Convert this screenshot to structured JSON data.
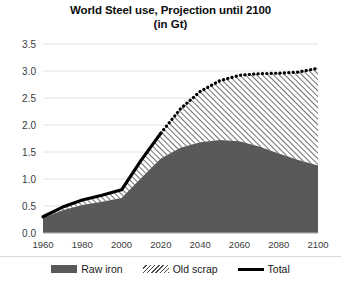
{
  "chart": {
    "title": "World Steel use, Projection until 2100",
    "subtitle": "(in Gt)"
  },
  "legend": {
    "items": [
      {
        "label": "Raw iron",
        "swatch": "solid-fill",
        "color": "#595959"
      },
      {
        "label": "Old scrap",
        "swatch": "diagonal-hatch",
        "color": "#4a4a4a"
      },
      {
        "label": "Total",
        "swatch": "line",
        "color": "#000000"
      }
    ]
  },
  "axes": {
    "y_ticks": [
      "0.0",
      "0.5",
      "1.0",
      "1.5",
      "2.0",
      "2.5",
      "3.0",
      "3.5"
    ],
    "x_ticks": [
      "1960",
      "1980",
      "2000",
      "2020",
      "2040",
      "2060",
      "2080",
      "2100"
    ]
  },
  "chart_data": {
    "type": "area",
    "title": "World Steel use, Projection until 2100",
    "subtitle": "(in Gt)",
    "xlabel": "",
    "ylabel": "",
    "unit": "Gt",
    "stacked": true,
    "grid": true,
    "legend_position": "bottom",
    "xlim": [
      1960,
      2100
    ],
    "ylim": [
      0.0,
      3.5
    ],
    "ytick_interval": 0.5,
    "xtick_interval": 20,
    "x": [
      1960,
      1970,
      1980,
      1990,
      2000,
      2010,
      2020,
      2030,
      2040,
      2050,
      2060,
      2070,
      2080,
      2090,
      2100
    ],
    "series": [
      {
        "name": "Raw iron",
        "style": "solid-fill",
        "color": "#595959",
        "values": [
          0.28,
          0.42,
          0.52,
          0.58,
          0.65,
          1.02,
          1.38,
          1.58,
          1.68,
          1.72,
          1.7,
          1.6,
          1.47,
          1.35,
          1.25
        ]
      },
      {
        "name": "Old scrap",
        "style": "diagonal-hatch",
        "color": "#4a4a4a",
        "values": [
          0.02,
          0.06,
          0.09,
          0.12,
          0.15,
          0.33,
          0.47,
          0.72,
          0.94,
          1.1,
          1.22,
          1.35,
          1.49,
          1.63,
          1.8
        ]
      }
    ],
    "total_line": {
      "name": "Total",
      "color": "#000000",
      "values": [
        0.3,
        0.48,
        0.61,
        0.7,
        0.8,
        1.35,
        1.85,
        2.3,
        2.62,
        2.82,
        2.92,
        2.95,
        2.96,
        2.98,
        3.05
      ],
      "solid_until": 2020,
      "dotted_from": 2020
    }
  }
}
